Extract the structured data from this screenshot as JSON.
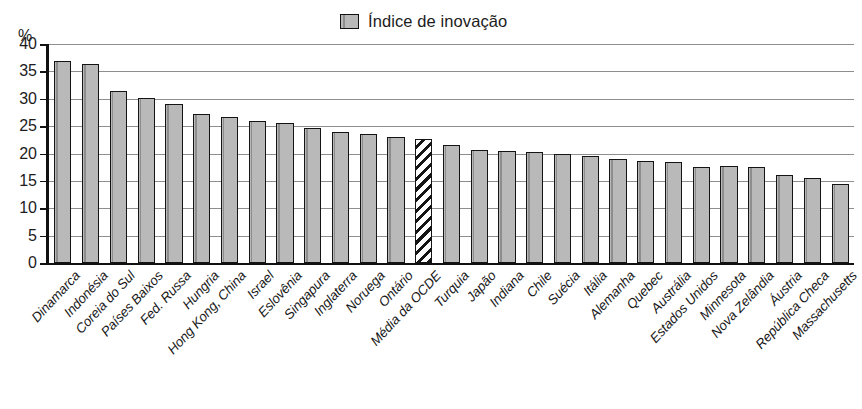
{
  "axis": {
    "unit_label": "%",
    "y_ticks": [
      "0",
      "5",
      "10",
      "15",
      "20",
      "25",
      "30",
      "35",
      "40"
    ]
  },
  "legend": {
    "entries": [
      {
        "label": "Índice de inovação",
        "swatch": "bar-swatch-gray",
        "color": "#b9b9b9"
      }
    ]
  },
  "colors": {
    "bar_fill": "#b9b9b9",
    "bar_stroke": "#141414",
    "gridline": "#8e8e8e",
    "axis": "#111111",
    "background": "#ffffff"
  },
  "chart_data": {
    "type": "bar",
    "title": "",
    "subtitle": "",
    "xlabel": "",
    "ylabel": "%",
    "ylim": [
      0,
      40
    ],
    "ytick_step": 5,
    "grid": true,
    "legend_position": "top-center",
    "series_name": "Índice de inovação",
    "categories": [
      "Dinamarca",
      "Indonésia",
      "Coreia do Sul",
      "Países Baixos",
      "Fed. Russa",
      "Hungria",
      "Hong Kong, China",
      "Israel",
      "Eslovênia",
      "Singapura",
      "Inglaterra",
      "Noruega",
      "Ontário",
      "Média da OCDE",
      "Turquia",
      "Japão",
      "Indiana",
      "Chile",
      "Suécia",
      "Itália",
      "Alemanha",
      "Quebec",
      "Austrália",
      "Estados Unidos",
      "Minnesota",
      "Nova Zelândia",
      "Áustria",
      "República Checa",
      "Massachusetts"
    ],
    "values": [
      36.9,
      36.3,
      31.4,
      30.1,
      29.1,
      27.3,
      26.7,
      26.0,
      25.6,
      24.6,
      24.0,
      23.6,
      23.0,
      22.7,
      21.5,
      20.7,
      20.4,
      20.2,
      20.0,
      19.5,
      19.0,
      18.6,
      18.5,
      17.6,
      17.7,
      17.5,
      16.1,
      15.5,
      14.5
    ],
    "highlighted_index": 13,
    "highlight_style": "diagonal-hatch"
  }
}
